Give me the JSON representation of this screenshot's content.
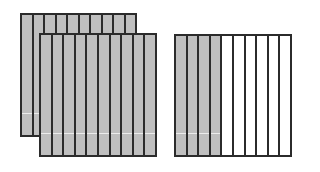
{
  "diagram": {
    "colors": {
      "shaded": "#bfbfbf",
      "unshaded": "#ffffff",
      "outline": "#2b2b2b"
    },
    "models": [
      {
        "name": "back-whole-bar",
        "parts": 10,
        "shaded": 10,
        "x": 20,
        "y": 13,
        "w": 117,
        "h": 124
      },
      {
        "name": "front-whole-bar",
        "parts": 10,
        "shaded": 10,
        "x": 39,
        "y": 33,
        "w": 118,
        "h": 124
      },
      {
        "name": "partial-bar",
        "parts": 10,
        "shaded": 4,
        "x": 174,
        "y": 34,
        "w": 118,
        "h": 123
      }
    ]
  }
}
